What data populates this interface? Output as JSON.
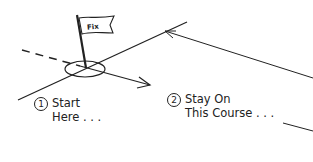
{
  "flag": {
    "text": "Fix"
  },
  "steps": [
    {
      "number": "1",
      "line1": "Start",
      "line2": "Here . . ."
    },
    {
      "number": "2",
      "line1": "Stay On",
      "line2": "This Course . . ."
    }
  ],
  "colors": {
    "stroke": "#222222",
    "background": "#ffffff"
  }
}
